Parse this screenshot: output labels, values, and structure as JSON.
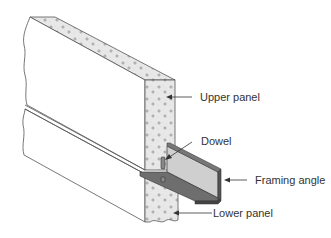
{
  "diagram": {
    "type": "technical-illustration",
    "colors": {
      "background": "#ffffff",
      "line": "#555555",
      "concrete_fill": "#e6e6e6",
      "angle_light": "#c8c8c8",
      "angle_dark": "#6e6e6e",
      "label_text": "#333333"
    },
    "labels": {
      "upper_panel": "Upper panel",
      "dowel": "Dowel",
      "framing_angle": "Framing angle",
      "lower_panel": "Lower panel"
    }
  }
}
